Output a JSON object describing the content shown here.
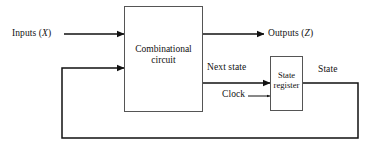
{
  "diagram": {
    "type": "block-diagram",
    "background_color": "#ffffff",
    "line_color": "#111111",
    "box_fill": "#ffffff",
    "box_border_color": "#555555",
    "blocks": [
      {
        "id": "combinational-circuit",
        "label_line1": "Combinational",
        "label_line2": "circuit",
        "x": 124,
        "y": 6,
        "width": 79,
        "height": 106
      },
      {
        "id": "state-register",
        "label_line1": "State",
        "label_line2": "register",
        "x": 270,
        "y": 56,
        "width": 33,
        "height": 55
      }
    ],
    "labels": {
      "inputs_prefix": "Inputs (",
      "inputs_var": "X",
      "inputs_suffix": ")",
      "outputs_prefix": "Outputs (",
      "outputs_var": "Z",
      "outputs_suffix": ")",
      "next_state": "Next state",
      "clock": "Clock",
      "state": "State"
    },
    "signals": [
      {
        "name": "inputs",
        "from": "external",
        "to": "combinational-circuit",
        "arrow": "large"
      },
      {
        "name": "outputs",
        "from": "combinational-circuit",
        "to": "external",
        "arrow": "large"
      },
      {
        "name": "next-state",
        "from": "combinational-circuit",
        "to": "state-register",
        "arrow": "large"
      },
      {
        "name": "clock",
        "from": "external",
        "to": "state-register",
        "arrow": "small"
      },
      {
        "name": "state-feedback",
        "from": "state-register",
        "to": "combinational-circuit",
        "arrow": "large"
      }
    ]
  }
}
